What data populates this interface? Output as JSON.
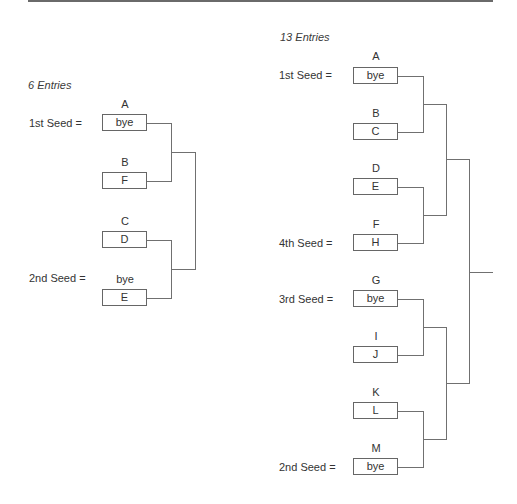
{
  "bracket_6": {
    "title": "6 Entries",
    "slots": [
      {
        "above": "A",
        "box": "bye",
        "seed_label": "1st Seed  ="
      },
      {
        "above": "B",
        "box": "F",
        "seed_label": ""
      },
      {
        "above": "C",
        "box": "D",
        "seed_label": ""
      },
      {
        "above": "bye",
        "box": "E",
        "seed_label": "2nd Seed  ="
      }
    ]
  },
  "bracket_13": {
    "title": "13 Entries",
    "slots": [
      {
        "above": "A",
        "box": "bye",
        "seed_label": "1st Seed  ="
      },
      {
        "above": "B",
        "box": "C",
        "seed_label": ""
      },
      {
        "above": "D",
        "box": "E",
        "seed_label": ""
      },
      {
        "above": "F",
        "box": "H",
        "seed_label": "4th Seed  ="
      },
      {
        "above": "G",
        "box": "bye",
        "seed_label": "3rd Seed  ="
      },
      {
        "above": "I",
        "box": "J",
        "seed_label": ""
      },
      {
        "above": "K",
        "box": "L",
        "seed_label": ""
      },
      {
        "above": "M",
        "box": "bye",
        "seed_label": "2nd Seed  ="
      }
    ]
  },
  "colors": {
    "line": "#707070",
    "box_border": "#666666",
    "text": "#333333"
  }
}
